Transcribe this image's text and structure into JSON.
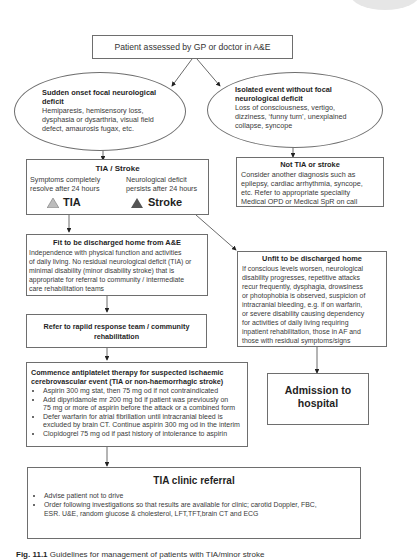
{
  "start": {
    "label": "Patient assessed by GP or doctor in A&E"
  },
  "focal": {
    "title": "Sudden onset focal neurological deficit",
    "title_line1": "Sudden onset focal neurological",
    "title_line2": "deficit",
    "lines": [
      "Hemiparesis, hemisensory loss,",
      "dysphasia or dysarthria, visual field",
      "defect, amaurosis fugax, etc."
    ]
  },
  "isolated": {
    "title_line1": "Isolated event without focal",
    "title_line2": "neurological deficit",
    "lines": [
      "Loss of consciousness, vertigo,",
      "dizziness, ‘funny turn’, unexplained",
      "collapse, syncope"
    ]
  },
  "tia_stroke": {
    "title": "TIA / Stroke",
    "tia_desc": [
      "Symptoms completely",
      "resolve after 24 hours"
    ],
    "stroke_desc": [
      "Neurological deficit",
      "persists after 24 hours"
    ],
    "tia_label": "TIA",
    "stroke_label": "Stroke",
    "tia_color": "#b8b8b8",
    "stroke_color": "#555555"
  },
  "not_tia": {
    "title": "Not TIA or stroke",
    "lines": [
      "Consider another diagnosis such as",
      "epilepsy, cardiac arrhythmia, syncope,",
      "etc. Refer to appropriate speciality",
      "Medical OPD or Medical SpR on call"
    ]
  },
  "fit": {
    "title": "Fit to be discharged home from A&E",
    "lines": [
      "Independence with physical function and activities",
      "of daily living. No residual neurological deficit (TIA) or",
      "minimal disability (minor disability stroke) that is",
      "appropriate for referral to  community / intermediate",
      "care rehabilitation teams"
    ]
  },
  "unfit": {
    "title": "Unfit to be discharged home",
    "lines": [
      "If conscious levels worsen, neurological",
      "disability progresses, repetitive attacks",
      "recur frequently, dysphagia, drowsiness",
      "or photophobia is observed, suspicion of",
      "intracranial bleeding, e.g. if on warfarin,",
      "or severe disability causing dependency",
      "for activities of daily living requiring",
      "inpatient rehabilitation, those in AF and",
      "those with residual symptoms/signs"
    ]
  },
  "refer": {
    "line1": "Refer to rapiid response team / community",
    "line2": "rehabilitation"
  },
  "antiplatelet": {
    "title_line1": "Commence antiplatelet therapy for suspected ischaemic",
    "title_line2": "cerebrovascular event (TIA or non-haemorrhagic stroke)",
    "bullets": [
      [
        "Aspirin 300 mg stat, then 75 mg od if not contraindicated"
      ],
      [
        "Add dipyridamole mr 200 mg bd if patient was previously on",
        "75 mg or more of aspirin before the attack or a combined form"
      ],
      [
        "Defer warfarin for atrial fibrillation until intracranial bleed is",
        "excluded by brain CT. Continue aspirin 300 mg od in the interim"
      ],
      [
        "Clopidogrel 75 mg od if past history of intolerance to aspirin"
      ]
    ]
  },
  "admission": {
    "line1": "Admission to",
    "line2": "hospital"
  },
  "clinic": {
    "title": "TIA clinic referral",
    "bullets": [
      [
        "Advise patient not to drive"
      ],
      [
        "Order following investigations so that results are available for clinic; carotid Doppler, FBC,",
        "ESR. U&E, random glucose & cholesterol, LFT,TFT,brain CT and ECG"
      ]
    ]
  },
  "caption": {
    "fig": "Fig. 11.1",
    "text": "Guidelines for management of patients with TIA/minor stroke"
  }
}
